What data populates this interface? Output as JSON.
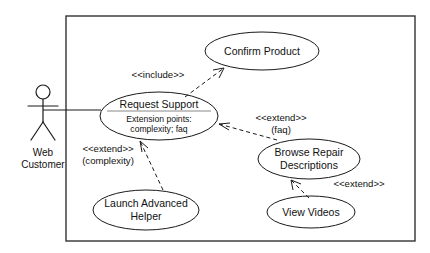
{
  "diagram": {
    "type": "uml-use-case-diagram",
    "canvas": {
      "width": 430,
      "height": 253
    },
    "background_color": "#ffffff",
    "line_color": "#1a1a1a",
    "boundary_color": "#333333"
  },
  "actor": {
    "name_line1": "Web",
    "name_line2": "Customer",
    "icon": "stick-figure-actor-icon"
  },
  "use_cases": {
    "confirm_product": {
      "label": "Confirm Product"
    },
    "request_support": {
      "label": "Request Support",
      "compartment_title": "Extension points:",
      "compartment_items": "complexity; faq"
    },
    "browse_repair_descriptions": {
      "label_line1": "Browse Repair",
      "label_line2": "Descriptions"
    },
    "launch_advanced_helper": {
      "label_line1": "Launch Advanced",
      "label_line2": "Helper"
    },
    "view_videos": {
      "label": "View Videos"
    }
  },
  "relationships": {
    "include_confirm_product": {
      "stereotype": "<<include>>",
      "from": "Request Support",
      "to": "Confirm Product",
      "kind": "include"
    },
    "extend_faq": {
      "stereotype": "<<extend>>",
      "condition": "(faq)",
      "from": "Browse Repair Descriptions",
      "to": "Request Support",
      "kind": "extend"
    },
    "extend_complexity": {
      "stereotype": "<<extend>>",
      "condition": "(complexity)",
      "from": "Launch Advanced Helper",
      "to": "Request Support",
      "kind": "extend"
    },
    "extend_videos": {
      "stereotype": "<<extend>>",
      "from": "View Videos",
      "to": "Browse Repair Descriptions",
      "kind": "extend"
    },
    "association_actor": {
      "from": "Web Customer",
      "to": "Request Support",
      "kind": "association"
    }
  }
}
